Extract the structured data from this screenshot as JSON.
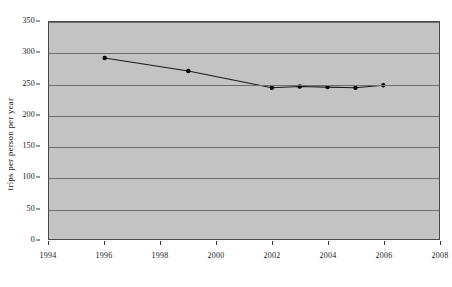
{
  "chart_data": {
    "type": "line",
    "title": "",
    "subtitle": "",
    "xlabel": "",
    "ylabel": "trips per person per year",
    "xlim": [
      1994,
      2008
    ],
    "ylim": [
      0,
      350
    ],
    "x": [
      1996,
      1999,
      2002,
      2003,
      2004,
      2005,
      2006
    ],
    "values": [
      292,
      271,
      244,
      246,
      245,
      244,
      248
    ],
    "series": [
      {
        "name": "trips per person per year",
        "x": [
          1996,
          1999,
          2002,
          2003,
          2004,
          2005,
          2006
        ],
        "values": [
          292,
          271,
          244,
          246,
          245,
          244,
          248
        ]
      }
    ],
    "xticks": [
      1994,
      1996,
      1998,
      2000,
      2002,
      2004,
      2006,
      2008
    ],
    "xtick_labels": [
      "1994",
      "1996",
      "1998",
      "2000",
      "2002",
      "2004",
      "2006",
      "2008"
    ],
    "yticks": [
      0,
      50,
      100,
      150,
      200,
      250,
      300,
      350
    ],
    "ytick_labels": [
      "0",
      "50",
      "100",
      "150",
      "200",
      "250",
      "300",
      "350"
    ],
    "grid": "horizontal",
    "legend": "none",
    "annotations": [],
    "colors": {
      "plot_background": "#c3c3c3",
      "figure_background": "#ffffff",
      "gridline": "#6e6e6e",
      "line": "#1a1a1a",
      "marker": "#000000",
      "axis": "#4a4a4a",
      "text": "#1a1a1a"
    },
    "marker": "filled-circle",
    "line_width": 1
  }
}
